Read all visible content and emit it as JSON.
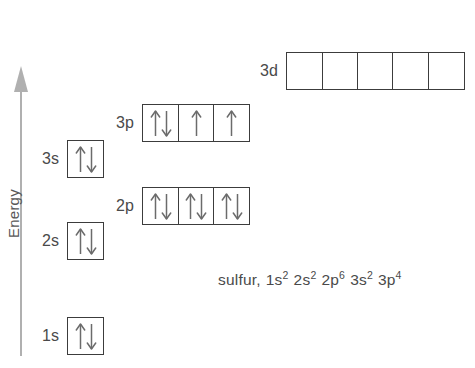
{
  "diagram": {
    "axis": {
      "label": "Energy",
      "icon": "up-arrow-icon",
      "direction": "up"
    },
    "element_name": "sulfur",
    "caption_prefix": "sulfur,",
    "colors": {
      "background": "#ffffff",
      "box_border": "#3c3c3c",
      "text": "#4a4a4a",
      "axis": "#b0b0b0",
      "arrow": "#6b6b6b"
    },
    "orbitals": [
      {
        "id": "3d",
        "label": "3d",
        "electrons": 0,
        "boxes": [
          {
            "spins": []
          },
          {
            "spins": []
          },
          {
            "spins": []
          },
          {
            "spins": []
          },
          {
            "spins": []
          }
        ]
      },
      {
        "id": "3p",
        "label": "3p",
        "electrons": 4,
        "boxes": [
          {
            "spins": [
              "up",
              "down"
            ]
          },
          {
            "spins": [
              "up"
            ]
          },
          {
            "spins": [
              "up"
            ]
          }
        ]
      },
      {
        "id": "3s",
        "label": "3s",
        "electrons": 2,
        "boxes": [
          {
            "spins": [
              "up",
              "down"
            ]
          }
        ]
      },
      {
        "id": "2p",
        "label": "2p",
        "electrons": 6,
        "boxes": [
          {
            "spins": [
              "up",
              "down"
            ]
          },
          {
            "spins": [
              "up",
              "down"
            ]
          },
          {
            "spins": [
              "up",
              "down"
            ]
          }
        ]
      },
      {
        "id": "2s",
        "label": "2s",
        "electrons": 2,
        "boxes": [
          {
            "spins": [
              "up",
              "down"
            ]
          }
        ]
      },
      {
        "id": "1s",
        "label": "1s",
        "electrons": 2,
        "boxes": [
          {
            "spins": [
              "up",
              "down"
            ]
          }
        ]
      }
    ],
    "configuration": [
      {
        "base": "1s",
        "exponent": "2"
      },
      {
        "base": "2s",
        "exponent": "2"
      },
      {
        "base": "2p",
        "exponent": "6"
      },
      {
        "base": "3s",
        "exponent": "2"
      },
      {
        "base": "3p",
        "exponent": "4"
      }
    ]
  }
}
